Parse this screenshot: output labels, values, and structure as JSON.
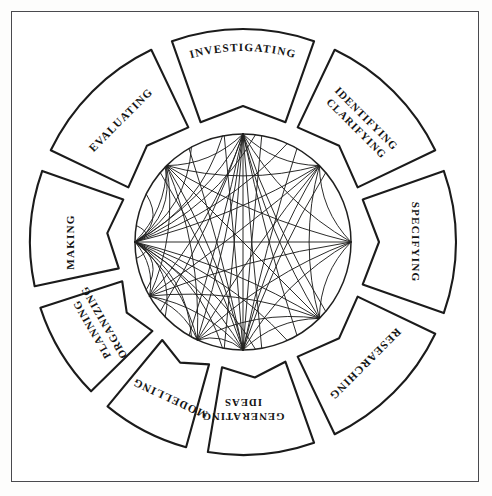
{
  "figure": {
    "border_color": "#4a4a4e",
    "line_color": "#20201f",
    "background": "#ffffff"
  },
  "wheel": {
    "center_x": 243,
    "center_y": 242,
    "outer_radius": 213,
    "segment_inner_radius": 127,
    "hub_radius": 108,
    "segment_gap_degrees": 6,
    "segments": [
      {
        "id": "investigating",
        "label": "INVESTIGATING",
        "lines": [
          "INVESTIGATING"
        ],
        "mid_angle": 270,
        "text_style": "curved-arc"
      },
      {
        "id": "identifying-clarifying",
        "label": "IDENTIFYING CLARIFYING",
        "lines": [
          "IDENTIFYING",
          "CLARIFYING"
        ],
        "mid_angle": 315,
        "text_style": "rotated"
      },
      {
        "id": "specifying",
        "label": "SPECIFYING",
        "lines": [
          "SPECIFYING"
        ],
        "mid_angle": 0,
        "text_style": "rotated"
      },
      {
        "id": "researching",
        "label": "RESEARCHING",
        "lines": [
          "RESEARCHING"
        ],
        "mid_angle": 45,
        "text_style": "rotated"
      },
      {
        "id": "generating-ideas",
        "label": "GENERATING IDEAS",
        "lines": [
          "GENERATING",
          "IDEAS"
        ],
        "mid_angle": 90,
        "text_style": "rotated"
      },
      {
        "id": "modelling",
        "label": "MODELLING",
        "lines": [
          "MODELLING"
        ],
        "mid_angle": 115,
        "text_style": "rotated"
      },
      {
        "id": "planning-organizing",
        "label": "PLANNING ORGANIZING",
        "lines": [
          "PLANNING",
          "ORGANIZING"
        ],
        "mid_angle": 150,
        "text_style": "rotated"
      },
      {
        "id": "making",
        "label": "MAKING",
        "lines": [
          "MAKING"
        ],
        "mid_angle": 180,
        "text_style": "rotated"
      },
      {
        "id": "evaluating",
        "label": "EVALUATING",
        "lines": [
          "EVALUATING"
        ],
        "mid_angle": 225,
        "text_style": "rotated"
      }
    ]
  },
  "chord_network": {
    "description": "Curved chords linking every segment node inside the central circle",
    "node_count": 9,
    "hub_node": "making",
    "node_angles": [
      270,
      315,
      0,
      45,
      90,
      115,
      150,
      180,
      225
    ],
    "links": [
      [
        0,
        1
      ],
      [
        0,
        2
      ],
      [
        0,
        3
      ],
      [
        0,
        4
      ],
      [
        0,
        5
      ],
      [
        0,
        6
      ],
      [
        0,
        7
      ],
      [
        0,
        8
      ],
      [
        1,
        2
      ],
      [
        1,
        3
      ],
      [
        1,
        4
      ],
      [
        1,
        5
      ],
      [
        1,
        6
      ],
      [
        1,
        7
      ],
      [
        1,
        8
      ],
      [
        2,
        3
      ],
      [
        2,
        4
      ],
      [
        2,
        5
      ],
      [
        2,
        6
      ],
      [
        2,
        7
      ],
      [
        2,
        8
      ],
      [
        3,
        4
      ],
      [
        3,
        5
      ],
      [
        3,
        6
      ],
      [
        3,
        7
      ],
      [
        3,
        8
      ],
      [
        4,
        5
      ],
      [
        4,
        6
      ],
      [
        4,
        7
      ],
      [
        4,
        8
      ],
      [
        5,
        6
      ],
      [
        5,
        7
      ],
      [
        5,
        8
      ],
      [
        6,
        7
      ],
      [
        6,
        8
      ],
      [
        7,
        8
      ]
    ],
    "extra_hub_links": 14
  }
}
